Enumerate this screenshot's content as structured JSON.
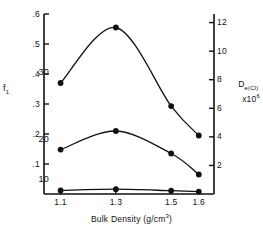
{
  "chart_data": {
    "type": "line",
    "title": "",
    "xlabel": "Bulk Density  (g/cm3)",
    "xlabel_base": "Bulk Density  (g/cm",
    "xlabel_sup": "3",
    "xlabel_close": ")",
    "ylabel_left": "f",
    "ylabel_left_sub": "1",
    "ylabel_right_line1_base": "D",
    "ylabel_right_line1_sub": "e(Cl)",
    "ylabel_right_line2_base": "x10",
    "ylabel_right_line2_sup": "6",
    "x": [
      1.1,
      1.3,
      1.5,
      1.6
    ],
    "xtick_labels": [
      "1.1",
      "1.3",
      "1.5",
      "1.6"
    ],
    "xlim": [
      1.04,
      1.655
    ],
    "ylim_left": [
      0,
      0.6
    ],
    "ytick_values_left": [
      0.1,
      0.2,
      0.3,
      0.4,
      0.5,
      0.6
    ],
    "ytick_labels_left": [
      ".1",
      ".2",
      ".3",
      ".4",
      ".5",
      ".6"
    ],
    "ylim_right": [
      0,
      12.6
    ],
    "ytick_values_right": [
      2,
      4,
      6,
      8,
      10,
      12
    ],
    "ytick_labels_right": [
      "2",
      "4",
      "6",
      "8",
      "10",
      "12"
    ],
    "grid": false,
    "legend_position": "inline-left-of-first-point",
    "series": [
      {
        "name": "30",
        "label": "30",
        "values": [
          0.37,
          0.555,
          0.293,
          0.195
        ],
        "values_right_axis": [
          7.4,
          11.1,
          5.86,
          3.9
        ],
        "marker": "filled-circle",
        "color": "#111111"
      },
      {
        "name": "20",
        "label": "20",
        "values": [
          0.148,
          0.21,
          0.135,
          0.065
        ],
        "values_right_axis": [
          2.96,
          4.2,
          2.7,
          1.3
        ],
        "marker": "filled-circle",
        "color": "#111111"
      },
      {
        "name": "10",
        "label": "10",
        "values": [
          0.012,
          0.016,
          0.011,
          0.008
        ],
        "values_right_axis": [
          0.24,
          0.32,
          0.22,
          0.16
        ],
        "marker": "filled-circle",
        "color": "#111111"
      }
    ]
  },
  "figure": {
    "background": "#ffffff",
    "axis_color": "#111111"
  }
}
